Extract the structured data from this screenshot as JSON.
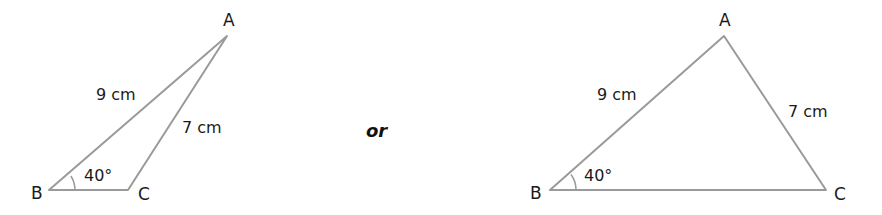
{
  "diagram": {
    "connector": "or",
    "colors": {
      "line": "#9a9a9a",
      "text": "#1a1a1a"
    },
    "triangles": [
      {
        "id": "obtuse",
        "vertices": {
          "A": "A",
          "B": "B",
          "C": "C"
        },
        "sides": {
          "AB": "9 cm",
          "AC": "7 cm"
        },
        "angle_B": "40°"
      },
      {
        "id": "acute",
        "vertices": {
          "A": "A",
          "B": "B",
          "C": "C"
        },
        "sides": {
          "AB": "9 cm",
          "AC": "7 cm"
        },
        "angle_B": "40°"
      }
    ]
  }
}
